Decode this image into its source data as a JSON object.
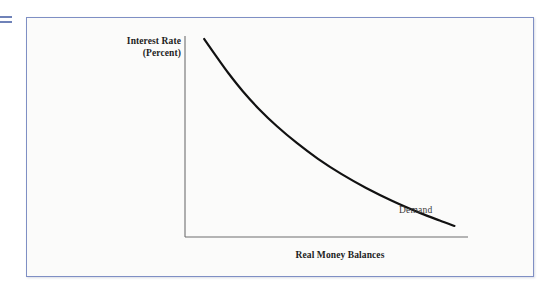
{
  "figure": {
    "border_color": "#7f8fc4",
    "background_color": "#fbfbfa",
    "edge_marker_color": "#6f82b8"
  },
  "chart_data": {
    "type": "line",
    "title": "",
    "subtitle": "",
    "xlabel": "Real Money Balances",
    "ylabel": "Interest Rate (Percent)",
    "ylabel_line1": "Interest Rate",
    "ylabel_line2": "(Percent)",
    "grid": false,
    "legend_position": "inline-annotation",
    "annotations": [
      {
        "text": "Demand",
        "attached_to": "money-demand-curve",
        "x_frac": 0.63,
        "y_frac": 0.78
      }
    ],
    "axes": {
      "x_axis_visible": true,
      "y_axis_visible": true,
      "x_tick_labels": [],
      "y_tick_labels": [],
      "xlim": [
        0,
        1
      ],
      "ylim": [
        0,
        1
      ]
    },
    "series": [
      {
        "name": "Demand",
        "line_color": "#111111",
        "line_width": 2.2,
        "description": "Downward-sloping convex money demand curve",
        "points": [
          {
            "x": 0.068,
            "y": 0.985
          },
          {
            "x": 0.11,
            "y": 0.9
          },
          {
            "x": 0.155,
            "y": 0.812
          },
          {
            "x": 0.205,
            "y": 0.724
          },
          {
            "x": 0.262,
            "y": 0.636
          },
          {
            "x": 0.325,
            "y": 0.551
          },
          {
            "x": 0.395,
            "y": 0.468
          },
          {
            "x": 0.47,
            "y": 0.389
          },
          {
            "x": 0.552,
            "y": 0.314
          },
          {
            "x": 0.64,
            "y": 0.244
          },
          {
            "x": 0.735,
            "y": 0.178
          },
          {
            "x": 0.83,
            "y": 0.12
          },
          {
            "x": 0.9,
            "y": 0.082
          },
          {
            "x": 0.952,
            "y": 0.055
          }
        ]
      }
    ]
  }
}
